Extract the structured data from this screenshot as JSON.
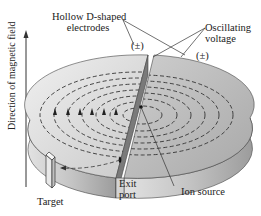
{
  "diagram": {
    "labels": {
      "electrodes": [
        "Hollow D-shaped",
        "electrodes"
      ],
      "voltage": [
        "Oscillating",
        "voltage"
      ],
      "pm_left": "(±)",
      "pm_right": "(±)",
      "magnetic_field": "Direction of magnetic field",
      "target": "Target",
      "exit_port": [
        "Exit",
        "port"
      ],
      "ion_source": "Ion source"
    },
    "colors": {
      "disk_top_light": "#e6e6e6",
      "disk_top_dark": "#b4b4b4",
      "disk_side": "#a9a9a9",
      "gap_face": "#7a7a7a",
      "line": "#333333"
    }
  }
}
